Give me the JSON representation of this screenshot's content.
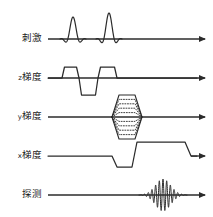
{
  "figure": {
    "type": "mri-pulse-sequence-diagram",
    "background_color": "#ffffff",
    "line_color": "#2b2b2b",
    "width": 213,
    "height": 217
  },
  "rows": [
    {
      "id": "excitation",
      "label": "刺激",
      "axis_prefix": "",
      "label_x": 42,
      "baseline_y": 39,
      "axis_start_x": 48,
      "axis_end_x": 205,
      "waveform": "rf-sinc-pulses",
      "description": "Two sinc-shaped radiofrequency excitation pulses"
    },
    {
      "id": "z-gradient",
      "label": "梯度",
      "axis_prefix": "z",
      "label_x": 42,
      "baseline_y": 78,
      "axis_start_x": 48,
      "axis_end_x": 205,
      "waveform": "slice-select-trapezoids",
      "description": "Positive lobe, negative rephasing lobe, positive lobe"
    },
    {
      "id": "y-gradient",
      "label": "梯度",
      "axis_prefix": "y",
      "label_x": 42,
      "baseline_y": 117,
      "axis_start_x": 48,
      "axis_end_x": 205,
      "waveform": "phase-encode-ladder",
      "description": "Dotted stepped phase-encoding table, symmetric above and below baseline"
    },
    {
      "id": "x-gradient",
      "label": "梯度",
      "axis_prefix": "x",
      "label_x": 42,
      "baseline_y": 156,
      "axis_start_x": 48,
      "axis_end_x": 205,
      "waveform": "readout-dephase-rephase",
      "description": "Negative dephasing lobe then long positive readout lobe"
    },
    {
      "id": "detection",
      "label": "探测",
      "axis_prefix": "",
      "label_x": 42,
      "baseline_y": 195,
      "axis_start_x": 48,
      "axis_end_x": 205,
      "waveform": "spin-echo-signal",
      "description": "Gaussian-enveloped oscillating echo signal"
    }
  ],
  "chart_data": {
    "type": "line",
    "title": "",
    "xlabel": "",
    "ylabel": "",
    "grid": false,
    "legend_position": "left-labels",
    "categories": [
      "刺激",
      "z梯度",
      "y梯度",
      "x梯度",
      "探测"
    ],
    "series": [
      {
        "name": "刺激",
        "events": [
          {
            "kind": "sinc-pulse",
            "center_x": 73,
            "half_width": 13,
            "amplitude": 22,
            "lobes": 2
          },
          {
            "kind": "sinc-pulse",
            "center_x": 109,
            "half_width": 13,
            "amplitude": 26,
            "lobes": 2
          }
        ]
      },
      {
        "name": "z梯度",
        "events": [
          {
            "kind": "trapezoid",
            "start_x": 62,
            "end_x": 79,
            "amplitude": 11
          },
          {
            "kind": "trapezoid",
            "start_x": 79,
            "end_x": 98,
            "amplitude": -17
          },
          {
            "kind": "trapezoid",
            "start_x": 98,
            "end_x": 117,
            "amplitude": 11
          }
        ]
      },
      {
        "name": "y梯度",
        "events": [
          {
            "kind": "phase-encode-ladder",
            "start_x": 112,
            "end_x": 142,
            "max_amplitude": 22,
            "steps": 5,
            "dotted": true
          }
        ]
      },
      {
        "name": "x梯度",
        "events": [
          {
            "kind": "trapezoid",
            "start_x": 112,
            "end_x": 132,
            "amplitude": -11
          },
          {
            "kind": "trapezoid",
            "start_x": 132,
            "end_x": 185,
            "amplitude": 14
          },
          {
            "kind": "trapezoid",
            "start_x": 185,
            "end_x": 195,
            "amplitude": 0
          }
        ]
      },
      {
        "name": "探测",
        "events": [
          {
            "kind": "echo",
            "center_x": 163,
            "half_width": 24,
            "amplitude": 16,
            "oscillations": 13
          }
        ]
      }
    ]
  }
}
